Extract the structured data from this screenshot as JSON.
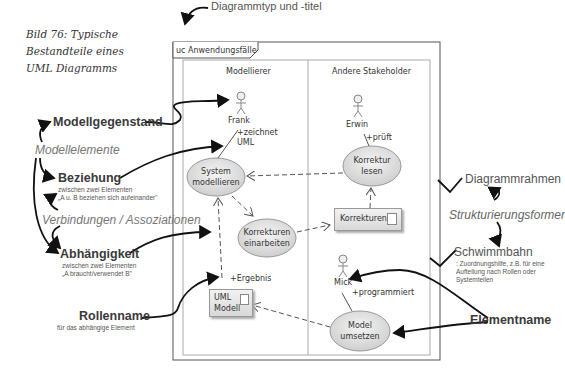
{
  "caption": {
    "lines": [
      "Bild 76: Typische",
      "Bestandteile eines",
      "UML Diagramms"
    ]
  },
  "frame": {
    "title": "uc Anwendungsfälle",
    "annotation": "Diagrammtyp und -titel"
  },
  "swimlanes": [
    {
      "label": "Modellierer"
    },
    {
      "label": "Andere Stakeholder"
    }
  ],
  "actors": [
    {
      "name": "Frank",
      "role": "+zeichnet UML",
      "role_lines": [
        "+zeichnet",
        "UML"
      ]
    },
    {
      "name": "Erwin",
      "role": "+prüft"
    },
    {
      "name": "Mick",
      "role": "+programmiert"
    }
  ],
  "use_cases": [
    {
      "lines": [
        "System",
        "modellieren"
      ]
    },
    {
      "lines": [
        "Korrektur",
        "lesen"
      ]
    },
    {
      "lines": [
        "Korrekturen",
        "einarbeiten"
      ]
    },
    {
      "lines": [
        "Model",
        "umsetzen"
      ]
    }
  ],
  "artifacts": [
    {
      "lines": [
        "Korrekturen"
      ]
    },
    {
      "lines": [
        "UML",
        "Modell"
      ],
      "role": "+Ergebnis"
    }
  ],
  "annotations_left": {
    "modellgegenstand": "Modellgegenstand",
    "modellelemente": "Modellelemente",
    "beziehung": {
      "title": "Beziehung",
      "line1": "zwischen zwei Elementen",
      "line2": "„A u. B beziehen sich aufeinander\""
    },
    "verbindungen": "Verbindungen / Assoziationen",
    "abhaengigkeit": {
      "title": "Abhängigkeit",
      "line1": "zwischen zwei Elementen",
      "line2": "„A braucht/verwendet B\""
    },
    "rollenname": {
      "title": "Rollenname",
      "line1": "für das abhängige Element"
    }
  },
  "annotations_right": {
    "diagrammrahmen": "Diagrammrahmen",
    "strukturierungsformer": "Strukturierungsformer",
    "schwimmbahn": {
      "title": "Schwimmbahn",
      "line1": ": Zuordnungshilfe, z.B. für eine",
      "line2": "Aufteilung nach Rollen oder",
      "line3": "Systemteilen"
    },
    "elementname": "Elementname"
  }
}
